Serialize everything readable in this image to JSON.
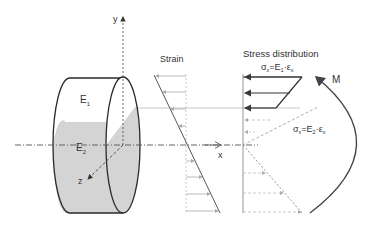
{
  "diagram": {
    "labels": {
      "y_axis": "y",
      "x_axis": "x",
      "z_axis": "z",
      "e1": "E",
      "e1_sub": "1",
      "e2": "E",
      "e2_sub": "2",
      "strain_title": "Strain",
      "stress_title": "Stress distribution",
      "formula_top": "σx=E1·εx",
      "formula_top_sigma": "σ",
      "formula_top_sigma_sub": "x",
      "formula_top_rhs": "=E",
      "formula_top_rhs_sub": "1",
      "formula_top_eps": "·ε",
      "formula_top_eps_sub": "x",
      "formula_bottom": "σx=E2·εx",
      "formula_bottom_sigma": "σ",
      "formula_bottom_sigma_sub": "x",
      "formula_bottom_rhs": "=E",
      "formula_bottom_rhs_sub": "2",
      "formula_bottom_eps": "·ε",
      "formula_bottom_eps_sub": "x",
      "moment": "M"
    },
    "colors": {
      "outline": "#2a2a2a",
      "fill_lower": "#d4d4d4",
      "fill_upper": "#ffffff",
      "axis": "#555555",
      "guide": "#bfbfbf",
      "arrow_light": "#a8a8a8",
      "arrow_dark": "#3a3a3a"
    }
  }
}
